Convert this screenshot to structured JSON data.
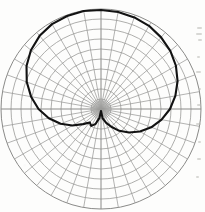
{
  "figure": {
    "kind": "polar-plot",
    "background_color": "#fdfdfc",
    "grid_color": "#9a9a98",
    "grid_color_major": "#8a8a88",
    "curve_color": "#121212",
    "curve_width_px": 2.1,
    "center_x": 101,
    "center_y": 109,
    "outer_radius_px": 100,
    "ring_count": 10,
    "spoke_count": 36,
    "hub_radius_px": 9,
    "hub_color": "#9e9e9c",
    "title": "",
    "axis_labels": [],
    "tick_labels": [],
    "legend": []
  },
  "chart_data": {
    "type": "line",
    "coordinate_system": "polar",
    "title": "",
    "subtitle": "",
    "xlabel": "",
    "ylabel": "",
    "grid": true,
    "legend_position": "none",
    "radial_axis": {
      "min": 0,
      "max": 1.0,
      "ring_count": 10,
      "ring_values": [
        0.1,
        0.2,
        0.3,
        0.4,
        0.5,
        0.6,
        0.7,
        0.8,
        0.9,
        1.0
      ],
      "tick_labels": []
    },
    "angular_axis": {
      "units": "degrees",
      "min": 0,
      "max": 360,
      "spoke_count": 36,
      "spoke_step_deg": 10,
      "zero_direction": "up",
      "tick_labels": []
    },
    "series": [
      {
        "name": "pattern",
        "color": "#121212",
        "closed": true,
        "theta_deg": [
          0,
          10,
          20,
          30,
          40,
          50,
          60,
          70,
          80,
          90,
          100,
          110,
          120,
          130,
          140,
          150,
          160,
          170,
          180,
          190,
          200,
          210,
          220,
          230,
          240,
          250,
          260,
          270,
          280,
          290,
          300,
          310,
          320,
          330,
          340,
          350
        ],
        "r": [
          0.99,
          0.985,
          0.975,
          0.96,
          0.935,
          0.905,
          0.865,
          0.815,
          0.755,
          0.69,
          0.615,
          0.535,
          0.45,
          0.365,
          0.285,
          0.205,
          0.145,
          0.095,
          0.02,
          0.09,
          0.16,
          0.195,
          0.175,
          0.235,
          0.33,
          0.43,
          0.53,
          0.625,
          0.71,
          0.79,
          0.86,
          0.915,
          0.955,
          0.98,
          0.99,
          0.995
        ]
      }
    ],
    "annotations": []
  },
  "bleed_marks": [
    {
      "x": 197,
      "y": 27,
      "w": 5,
      "h": 2
    },
    {
      "x": 196,
      "y": 33,
      "w": 6,
      "h": 2
    },
    {
      "x": 198,
      "y": 39,
      "w": 4,
      "h": 2
    },
    {
      "x": 197,
      "y": 56,
      "w": 3,
      "h": 2
    },
    {
      "x": 196,
      "y": 71,
      "w": 5,
      "h": 2
    },
    {
      "x": 198,
      "y": 88,
      "w": 3,
      "h": 2
    },
    {
      "x": 197,
      "y": 104,
      "w": 4,
      "h": 2
    },
    {
      "x": 196,
      "y": 123,
      "w": 5,
      "h": 2
    },
    {
      "x": 198,
      "y": 141,
      "w": 3,
      "h": 2
    },
    {
      "x": 197,
      "y": 158,
      "w": 4,
      "h": 2
    },
    {
      "x": 196,
      "y": 176,
      "w": 3,
      "h": 2
    }
  ]
}
